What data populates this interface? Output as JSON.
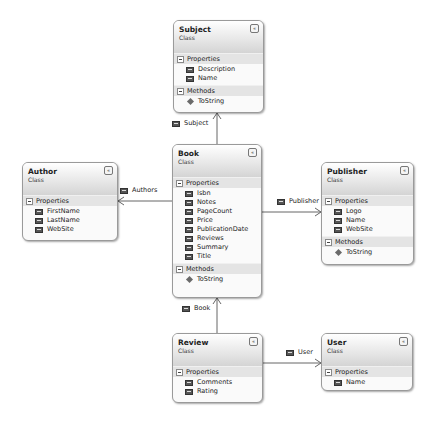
{
  "diagram": {
    "type": "class_diagram",
    "classes": [
      {
        "name": "Subject",
        "stereotype": "Class",
        "sections": [
          {
            "title": "Properties",
            "items": [
              "Description",
              "Name"
            ]
          },
          {
            "title": "Methods",
            "items": [
              "ToString"
            ]
          }
        ]
      },
      {
        "name": "Book",
        "stereotype": "Class",
        "sections": [
          {
            "title": "Properties",
            "items": [
              "Isbn",
              "Notes",
              "PageCount",
              "Price",
              "PublicationDate",
              "Reviews",
              "Summary",
              "Title"
            ]
          },
          {
            "title": "Methods",
            "items": [
              "ToString"
            ]
          }
        ]
      },
      {
        "name": "Author",
        "stereotype": "Class",
        "sections": [
          {
            "title": "Properties",
            "items": [
              "FirstName",
              "LastName",
              "WebSite"
            ]
          }
        ]
      },
      {
        "name": "Publisher",
        "stereotype": "Class",
        "sections": [
          {
            "title": "Properties",
            "items": [
              "Logo",
              "Name",
              "WebSite"
            ]
          },
          {
            "title": "Methods",
            "items": [
              "ToString"
            ]
          }
        ]
      },
      {
        "name": "Review",
        "stereotype": "Class",
        "sections": [
          {
            "title": "Properties",
            "items": [
              "Comments",
              "Rating"
            ]
          }
        ]
      },
      {
        "name": "User",
        "stereotype": "Class",
        "sections": [
          {
            "title": "Properties",
            "items": [
              "Name"
            ]
          }
        ]
      }
    ],
    "associations": [
      {
        "from": "Book",
        "to": "Subject",
        "label": "Subject"
      },
      {
        "from": "Book",
        "to": "Author",
        "label": "Authors"
      },
      {
        "from": "Book",
        "to": "Publisher",
        "label": "Publisher"
      },
      {
        "from": "Review",
        "to": "Book",
        "label": "Book"
      },
      {
        "from": "Review",
        "to": "User",
        "label": "User"
      }
    ],
    "collapse_glyph": "«"
  }
}
